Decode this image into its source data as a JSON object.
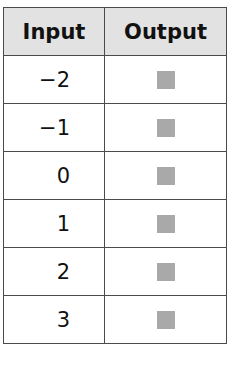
{
  "table": {
    "headers": [
      "Input",
      "Output"
    ],
    "rows": [
      {
        "input": "−2",
        "output": "blank"
      },
      {
        "input": "−1",
        "output": "blank"
      },
      {
        "input": "0",
        "output": "blank"
      },
      {
        "input": "1",
        "output": "blank"
      },
      {
        "input": "2",
        "output": "blank"
      },
      {
        "input": "3",
        "output": "blank"
      }
    ],
    "placeholder_color": "#a9a9a9",
    "header_bg": "#e2e2e2"
  }
}
